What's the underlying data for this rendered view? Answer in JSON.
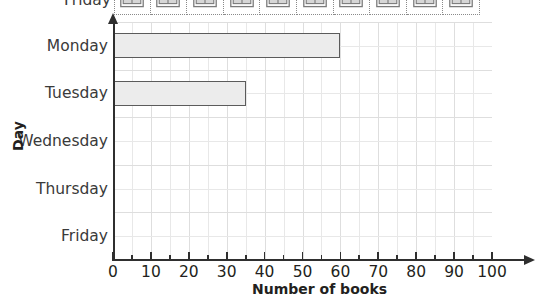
{
  "pictogram": {
    "row_label": "Friday",
    "icon_name": "open-book-icon",
    "icon_count": 10,
    "cells_visible": 10
  },
  "chart_data": {
    "type": "bar",
    "orientation": "horizontal",
    "title": "",
    "xlabel": "Number of books",
    "ylabel": "Day",
    "categories": [
      "Monday",
      "Tuesday",
      "Wednesday",
      "Thursday",
      "Friday"
    ],
    "values": [
      60,
      35,
      0,
      0,
      0
    ],
    "xlim": [
      0,
      100
    ],
    "xticks": [
      0,
      10,
      20,
      30,
      40,
      50,
      60,
      70,
      80,
      90,
      100
    ],
    "xtick_labels": [
      "0",
      "10",
      "20",
      "30",
      "40",
      "50",
      "60",
      "70",
      "80",
      "90",
      "100"
    ],
    "minor_tick_step": 5,
    "grid": true,
    "legend": "none",
    "bar_fill": "#ececec",
    "bar_edge": "#5b5b5b",
    "axis_color": "#2f2f2f"
  }
}
